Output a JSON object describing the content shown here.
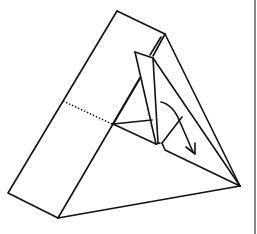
{
  "diagram": {
    "type": "origami-fold-step",
    "colors": {
      "line": "#111111",
      "background": "#ffffff",
      "frame": "#555555"
    },
    "elements": [
      "outer-triangular-body",
      "left-side-face",
      "dotted-crease-line",
      "inner-flap",
      "curved-fold-arrow",
      "right-frame-border"
    ]
  }
}
